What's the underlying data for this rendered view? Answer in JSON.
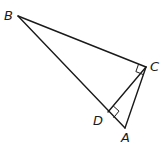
{
  "diagram": {
    "type": "geometry",
    "points": {
      "B": {
        "label": "B",
        "x": 18,
        "y": 16
      },
      "C": {
        "label": "C",
        "x": 146,
        "y": 67
      },
      "A": {
        "label": "A",
        "x": 125,
        "y": 128
      },
      "D": {
        "label": "D",
        "x": 108,
        "y": 112
      }
    },
    "labels": {
      "B": "B",
      "C": "C",
      "A": "A",
      "D": "D"
    },
    "segments": [
      "BC",
      "CA",
      "AB",
      "CD"
    ],
    "right_angles": [
      "C (angle BCA)",
      "D (angle CDA)"
    ],
    "colors": {
      "stroke": "#1a1a1a",
      "background": "#ffffff"
    }
  }
}
